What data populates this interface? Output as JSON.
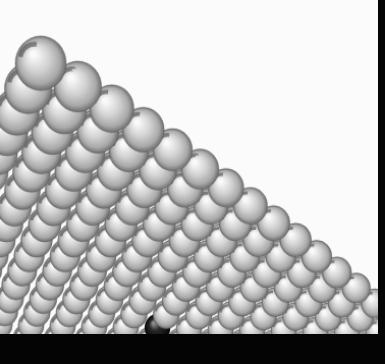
{
  "image": {
    "subject": "grid of silver reflective spheres receding in perspective with one black sphere",
    "background_color": "#fbfbfb",
    "border_color": "#050505",
    "sphere_color": "#c8c8c8",
    "highlight_sphere_color": "#111111",
    "caption_band_text": ""
  },
  "scene": {
    "rows": 22,
    "columns": 30,
    "odd_sphere": {
      "row": 7,
      "column": 8
    }
  }
}
